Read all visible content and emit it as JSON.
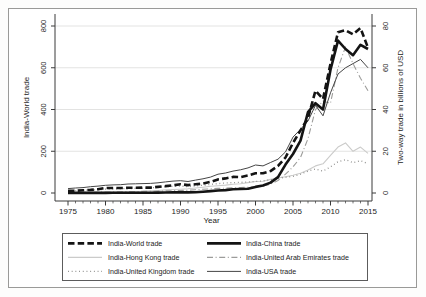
{
  "figure": {
    "x_axis": {
      "label": "Year",
      "ticks": [
        1975,
        1980,
        1985,
        1990,
        1995,
        2000,
        2005,
        2010,
        2015
      ],
      "minor_step": 1,
      "range": [
        1975,
        2015
      ]
    },
    "left_axis": {
      "label": "India-World trade",
      "ticks": [
        0,
        200,
        400,
        600,
        800
      ],
      "range": [
        0,
        800
      ]
    },
    "right_axis": {
      "label": "Two-way trade in billions of USD",
      "ticks": [
        0,
        20,
        40,
        60,
        80
      ],
      "range": [
        0,
        80
      ]
    },
    "legend": {
      "entries": [
        {
          "series": 0
        },
        {
          "series": 1
        },
        {
          "series": 2
        },
        {
          "series": 3
        },
        {
          "series": 4
        },
        {
          "series": 5
        }
      ]
    },
    "colors": {
      "axis": "#3a3a3a",
      "grid": "#e3e3e2",
      "border": "#9a9a98",
      "legend_border": "#5c5c5c",
      "ink": "#1c1c1c"
    }
  },
  "chart_data": {
    "type": "line",
    "x": [
      1975,
      1976,
      1977,
      1978,
      1979,
      1980,
      1981,
      1982,
      1983,
      1984,
      1985,
      1986,
      1987,
      1988,
      1989,
      1990,
      1991,
      1992,
      1993,
      1994,
      1995,
      1996,
      1997,
      1998,
      1999,
      2000,
      2001,
      2002,
      2003,
      2004,
      2005,
      2006,
      2007,
      2008,
      2009,
      2010,
      2011,
      2012,
      2013,
      2014,
      2015
    ],
    "series": [
      {
        "name": "India-World trade",
        "slug": "india-world-trade",
        "axis": "left",
        "color": "#141414",
        "width": 2.6,
        "dash": "6.5,3.2",
        "values": [
          10,
          11,
          13,
          15,
          18,
          24,
          24,
          24,
          25,
          25,
          26,
          26,
          29,
          33,
          37,
          42,
          38,
          42,
          45,
          53,
          65,
          70,
          77,
          76,
          84,
          95,
          95,
          105,
          130,
          170,
          240,
          300,
          360,
          490,
          450,
          620,
          770,
          780,
          760,
          790,
          695
        ]
      },
      {
        "name": "India-China trade",
        "slug": "india-china-trade",
        "axis": "right",
        "color": "#141414",
        "width": 2.6,
        "dash": "",
        "values": [
          0.05,
          0.05,
          0.05,
          0.05,
          0.05,
          0.05,
          0.1,
          0.1,
          0.1,
          0.1,
          0.1,
          0.15,
          0.2,
          0.25,
          0.3,
          0.3,
          0.3,
          0.35,
          0.6,
          0.9,
          1.2,
          1.4,
          1.8,
          1.9,
          2.0,
          2.9,
          3.6,
          5.0,
          7.6,
          13.6,
          18.7,
          25.1,
          38.7,
          43,
          40,
          59,
          73,
          69,
          66,
          71,
          69
        ]
      },
      {
        "name": "India-Hong Kong trade",
        "slug": "india-hong-kong-trade",
        "axis": "right",
        "color": "#cbcbca",
        "width": 1.1,
        "dash": "",
        "values": [
          0.15,
          0.2,
          0.25,
          0.3,
          0.35,
          0.4,
          0.45,
          0.5,
          0.6,
          0.7,
          0.8,
          1.0,
          1.2,
          1.5,
          1.7,
          1.8,
          2.0,
          2.4,
          2.8,
          3.2,
          3.5,
          3.8,
          4.2,
          4.4,
          5.0,
          5.5,
          5.6,
          6.5,
          7.2,
          7.8,
          8.5,
          9.5,
          11,
          13,
          14,
          18,
          22,
          24,
          20,
          22,
          19
        ]
      },
      {
        "name": "India-United Arab Emirates trade",
        "slug": "india-uae-trade",
        "axis": "right",
        "color": "#9c9c9a",
        "width": 1.1,
        "dash": "6,2.6,1,2.6",
        "values": [
          0.2,
          0.25,
          0.3,
          0.35,
          0.4,
          0.5,
          0.55,
          0.6,
          0.65,
          0.7,
          0.75,
          0.8,
          0.9,
          1.0,
          1.1,
          1.2,
          1.3,
          1.6,
          1.8,
          2.0,
          2.2,
          2.3,
          2.5,
          2.6,
          2.8,
          3.0,
          3.3,
          4.2,
          6.0,
          9.0,
          12.5,
          17,
          26,
          40,
          44,
          43,
          60,
          70,
          62,
          55,
          49
        ]
      },
      {
        "name": "India-United Kingdom trade",
        "slug": "india-united-kingdom-trade",
        "axis": "right",
        "color": "#8b8b89",
        "width": 1.3,
        "dash": "0.9,2.8",
        "values": [
          1.0,
          1.1,
          1.3,
          1.4,
          1.6,
          1.8,
          1.9,
          2.0,
          2.1,
          2.2,
          2.3,
          2.5,
          2.8,
          3.0,
          3.2,
          3.3,
          3.0,
          3.4,
          3.7,
          4.1,
          4.5,
          4.8,
          5.0,
          5.1,
          5.3,
          5.5,
          5.8,
          6.3,
          7.0,
          7.5,
          8.0,
          9.0,
          10.5,
          11.5,
          10.5,
          12.5,
          15,
          16,
          14.5,
          15.5,
          14
        ]
      },
      {
        "name": "India-USA trade",
        "slug": "india-usa-trade",
        "axis": "right",
        "color": "#454545",
        "width": 1.0,
        "dash": "",
        "values": [
          2.1,
          2.4,
          2.6,
          3.0,
          3.3,
          3.7,
          3.9,
          4.0,
          4.3,
          4.4,
          4.5,
          4.6,
          4.9,
          5.3,
          5.7,
          5.9,
          5.5,
          6.2,
          6.8,
          7.6,
          9.0,
          9.6,
          10.5,
          11.1,
          12.0,
          13.4,
          13.0,
          14.6,
          16.2,
          19.7,
          26.8,
          30.5,
          34.5,
          42,
          37,
          48,
          57,
          60,
          62,
          64,
          60
        ]
      }
    ]
  }
}
